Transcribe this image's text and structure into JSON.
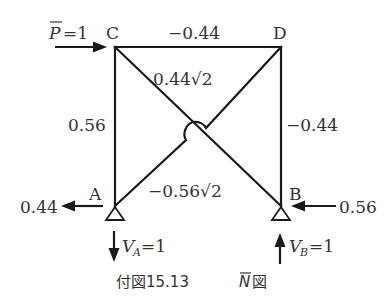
{
  "diagram": {
    "type": "truss axial force diagram",
    "nodes": [
      {
        "id": "C",
        "label": "C"
      },
      {
        "id": "D",
        "label": "D"
      },
      {
        "id": "A",
        "label": "A"
      },
      {
        "id": "B",
        "label": "B"
      }
    ],
    "members": [
      {
        "id": "CD",
        "from": "C",
        "to": "D",
        "label": "−0.44"
      },
      {
        "id": "AC",
        "from": "A",
        "to": "C",
        "label": "0.56"
      },
      {
        "id": "BD",
        "from": "B",
        "to": "D",
        "label": "−0.44"
      },
      {
        "id": "CB",
        "from": "C",
        "to": "B",
        "label": "0.44√2"
      },
      {
        "id": "AD",
        "from": "A",
        "to": "D",
        "label": "−0.56√2"
      }
    ],
    "loads": {
      "applied_load": {
        "at": "C",
        "direction": "right",
        "label_symbol": "P",
        "label_value": "=1"
      }
    },
    "reactions": {
      "A_horizontal": {
        "direction": "left",
        "label": "0.44"
      },
      "B_horizontal": {
        "direction": "left",
        "label": "0.56"
      },
      "A_vertical": {
        "direction": "down",
        "symbol": "V",
        "subscript": "A",
        "value": "=1"
      },
      "B_vertical": {
        "direction": "up",
        "symbol": "V",
        "subscript": "B",
        "value": "=1"
      }
    },
    "supports": [
      {
        "at": "A",
        "type": "pin"
      },
      {
        "at": "B",
        "type": "pin"
      }
    ]
  },
  "caption": {
    "prefix": "付図15.13",
    "symbol": "N",
    "suffix": "図"
  },
  "colors": {
    "line": "#1a1a1a",
    "text": "#333333",
    "background": "#ffffff"
  }
}
